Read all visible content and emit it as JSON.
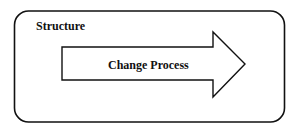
{
  "diagram": {
    "container": {
      "label": "Structure"
    },
    "arrow": {
      "label": "Change Process"
    }
  },
  "colors": {
    "stroke": "#111111",
    "background": "#ffffff"
  }
}
